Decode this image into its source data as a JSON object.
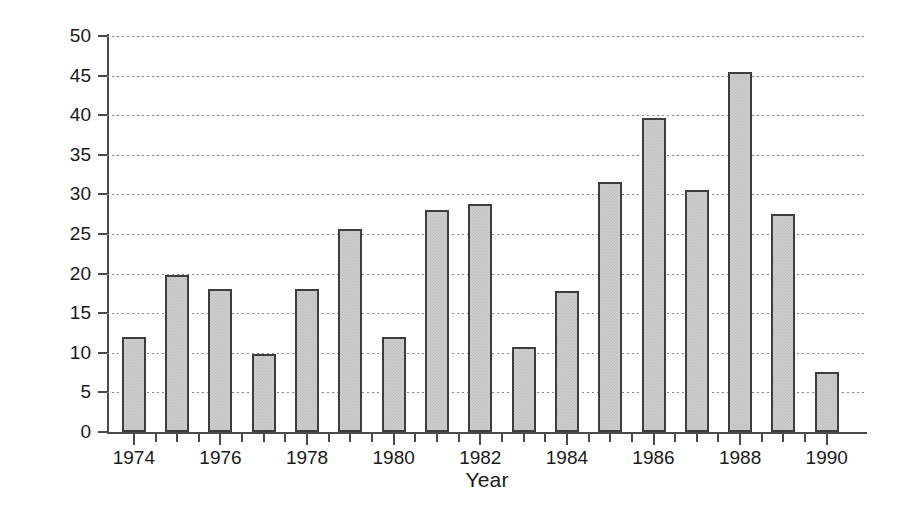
{
  "chart_data": {
    "type": "bar",
    "title": "",
    "xlabel": "Year",
    "ylabel": "Number of Offers",
    "categories": [
      "1974",
      "1975",
      "1976",
      "1977",
      "1978",
      "1979",
      "1980",
      "1981",
      "1982",
      "1983",
      "1984",
      "1985",
      "1986",
      "1987",
      "1988",
      "1989",
      "1990"
    ],
    "values": [
      12.0,
      19.8,
      18.0,
      9.9,
      18.0,
      25.6,
      12.0,
      28.0,
      28.8,
      10.7,
      17.8,
      31.6,
      39.7,
      30.6,
      45.5,
      27.5,
      7.6
    ],
    "ylim": [
      0,
      50
    ],
    "ytick_values": [
      0,
      5,
      10,
      15,
      20,
      25,
      30,
      35,
      40,
      45,
      50
    ],
    "ytick_labels": [
      "0",
      "5",
      "10",
      "15",
      "20",
      "25",
      "30",
      "35",
      "40",
      "45",
      "50"
    ],
    "xtick_labels": [
      "1974",
      "",
      "1976",
      "",
      "1978",
      "",
      "1980",
      "",
      "1982",
      "",
      "1984",
      "",
      "1986",
      "",
      "1988",
      "",
      "1990"
    ],
    "grid": "horizontal-dotted",
    "legend": "none",
    "bar_fill_color": "#cfcfcf",
    "bar_edge_color": "#3d3d3d",
    "grid_color": "#8a8a8a",
    "axis_color": "#4a4a4a",
    "background_color": "#ffffff"
  }
}
